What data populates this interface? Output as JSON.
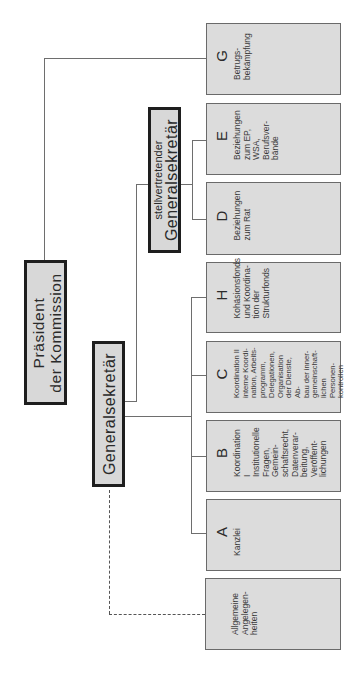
{
  "chart": {
    "orientation": "rotated-90-ccw",
    "president": {
      "line1": "Präsident",
      "line2": "der Kommission"
    },
    "secretary_general": {
      "title": "Generalsekretär"
    },
    "deputy_secretary_general": {
      "small": "stellvertretender",
      "title": "Generalsekretär"
    },
    "units": [
      {
        "id": "G",
        "letter": "G",
        "text": "Betrugs-\nbekämpfung",
        "reports_to": "president"
      },
      {
        "id": "E",
        "letter": "E",
        "text": "Beziehungen\nzum EP, WSA,\nBerufsver-\nbände",
        "reports_to": "deputy_secretary_general"
      },
      {
        "id": "D",
        "letter": "D",
        "text": "Beziehungen\nzum Rat",
        "reports_to": "deputy_secretary_general"
      },
      {
        "id": "H",
        "letter": "H",
        "text": "Kohäsionsfonds\nund Koordina-\ntion der\nStrukturfonds",
        "reports_to": "secretary_general"
      },
      {
        "id": "C",
        "letter": "C",
        "text": "Koordination II\ninterne Koordi-\nnation, Arbeits-\nprogramm,\nDelegationen,\nOrganisation\nder Dienste, Ab-\nbau der inner-\ngemeinschaft-\nlichen Personen-\nkontrollen",
        "reports_to": "secretary_general"
      },
      {
        "id": "B",
        "letter": "B",
        "text": "Koordination I\nInstitutionelle\nFragen,\nGemein-\nschaftsrecht,\nDatenverar-\nbeitung,\nVeröffent-\nlichungen",
        "reports_to": "secretary_general"
      },
      {
        "id": "A",
        "letter": "A",
        "text": "Kanzlei",
        "reports_to": "secretary_general"
      },
      {
        "id": "AA",
        "letter": "",
        "text": "Allgemeine\nAngelegen-\nheiten",
        "reports_to": "secretary_general",
        "link_style": "dash-dot"
      }
    ]
  },
  "colors": {
    "box_fill": "#dcdcdc",
    "box_border": "#6a6a6a",
    "lead_border": "#1e1e1e",
    "connector": "#6e6e6e",
    "background": "#ffffff"
  }
}
